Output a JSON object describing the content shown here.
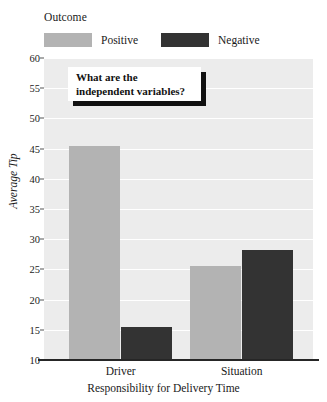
{
  "legend": {
    "title": "Outcome",
    "items": [
      {
        "label": "Positive",
        "color": "#b3b3b3"
      },
      {
        "label": "Negative",
        "color": "#333333"
      }
    ]
  },
  "annotation": {
    "text": "What are the\nindependent variables?"
  },
  "axes": {
    "ylabel": "Average Tip",
    "xlabel": "Responsibility for Delivery Time",
    "yticks": [
      "60",
      "55",
      "50",
      "45",
      "40",
      "35",
      "30",
      "25",
      "20",
      "15",
      "10"
    ]
  },
  "chart_data": {
    "type": "bar",
    "title": "",
    "xlabel": "Responsibility for Delivery Time",
    "ylabel": "Average Tip",
    "categories": [
      "Driver",
      "Situation"
    ],
    "ylim": [
      10,
      60
    ],
    "yticks": [
      10,
      15,
      20,
      25,
      30,
      35,
      40,
      45,
      50,
      55,
      60
    ],
    "grid": true,
    "legend_title": "Outcome",
    "legend_position": "top",
    "series": [
      {
        "name": "Positive",
        "color": "#b3b3b3",
        "values": [
          45.5,
          25.5
        ]
      },
      {
        "name": "Negative",
        "color": "#333333",
        "values": [
          15.4,
          28.2
        ]
      }
    ],
    "annotations": [
      "What are the independent variables?"
    ]
  }
}
